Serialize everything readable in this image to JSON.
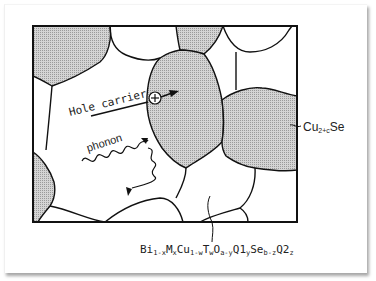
{
  "diagram": {
    "type": "microstructure-schematic",
    "labels": {
      "hole_carrier": "Hole carrier",
      "phonon": "phonon",
      "secondary_phase": {
        "base": "Cu",
        "sub": "2+c",
        "tail": "Se"
      },
      "matrix_phase": {
        "parts": [
          {
            "t": "Bi",
            "s": "1-x"
          },
          {
            "t": "M",
            "s": "x"
          },
          {
            "t": "Cu",
            "s": "1-w"
          },
          {
            "t": "T",
            "s": "w"
          },
          {
            "t": "O",
            "s": "a-y"
          },
          {
            "t": "Q1",
            "s": "y"
          },
          {
            "t": "Se",
            "s": "b-z"
          },
          {
            "t": "Q2",
            "s": "z"
          }
        ]
      }
    },
    "symbols": {
      "hole_symbol": "⊕"
    },
    "colors": {
      "boundary": "#111111",
      "secondary_fill": "#c9c9c9",
      "matrix_fill": "#ffffff",
      "text": "#222222"
    }
  }
}
